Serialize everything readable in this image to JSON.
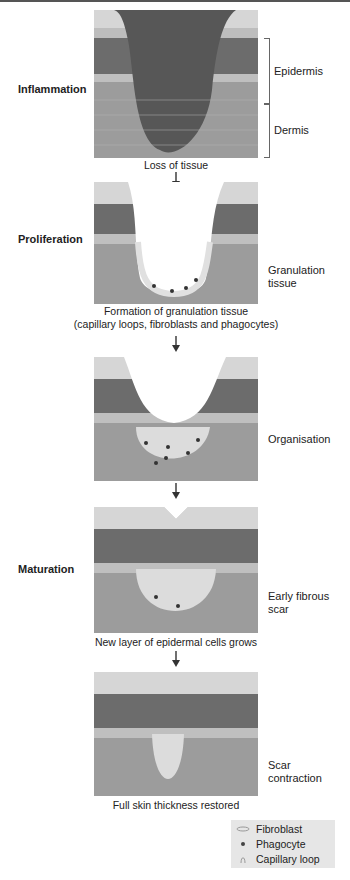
{
  "stages": [
    {
      "label": "Inflammation",
      "caption": "Loss of tissue",
      "side_label": "",
      "caption_extra": ""
    },
    {
      "label": "Proliferation",
      "caption": "Formation of granulation tissue",
      "caption_extra": "(capillary loops, fibroblasts and phagocytes)",
      "side_label_1": "Granulation",
      "side_label_2": "tissue"
    },
    {
      "label": "",
      "side_label": "Organisation"
    },
    {
      "label": "Maturation",
      "caption": "New layer of epidermal cells grows",
      "side_label_1": "Early fibrous",
      "side_label_2": "scar"
    },
    {
      "label": "",
      "caption": "Full skin thickness restored",
      "side_label_1": "Scar",
      "side_label_2": "contraction"
    }
  ],
  "layers": {
    "epidermis": "Epidermis",
    "dermis": "Dermis"
  },
  "legend": {
    "items": [
      {
        "icon": "fibroblast-icon",
        "label": "Fibroblast"
      },
      {
        "icon": "phagocyte-icon",
        "label": "Phagocyte"
      },
      {
        "icon": "capillary-loop-icon",
        "label": "Capillary loop"
      }
    ]
  },
  "colors": {
    "wound": "#5a5a5a",
    "dermis": "#9a9a9a",
    "epidermis_dark": "#666",
    "surface": "#d8d8d8"
  }
}
